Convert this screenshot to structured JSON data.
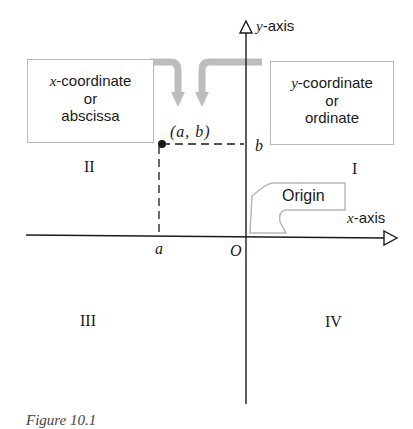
{
  "diagram": {
    "axes": {
      "y_axis_var": "y",
      "y_axis_suffix": "-axis",
      "x_axis_var": "x",
      "x_axis_suffix": "-axis",
      "origin_label": "O"
    },
    "point": {
      "label": "(a, b)",
      "x_label": "a",
      "y_label": "b"
    },
    "callouts": {
      "x_coordinate": {
        "var": "x",
        "line1_suffix": "-coordinate",
        "line2": "or",
        "line3": "abscissa"
      },
      "y_coordinate": {
        "var": "y",
        "line1_suffix": "-coordinate",
        "line2": "or",
        "line3": "ordinate"
      },
      "origin": "Origin"
    },
    "quadrants": {
      "I": "I",
      "II": "II",
      "III": "III",
      "IV": "IV"
    },
    "colors": {
      "axis": "#1a1a1a",
      "callout_border": "#b8b8b8",
      "arrow": "#bdbdbd"
    },
    "caption": "Figure 10.1"
  }
}
